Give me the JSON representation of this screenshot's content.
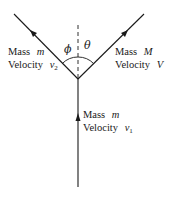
{
  "diagram": {
    "type": "collision-vector-diagram",
    "angles": {
      "left": "ϕ",
      "right": "θ"
    },
    "incoming": {
      "mass_label": "Mass",
      "mass_symbol": "m",
      "velocity_label": "Velocity",
      "velocity_symbol": "v",
      "velocity_subscript": "1"
    },
    "outgoing_left": {
      "mass_label": "Mass",
      "mass_symbol": "m",
      "velocity_label": "Velocity",
      "velocity_symbol": "v",
      "velocity_subscript": "2"
    },
    "outgoing_right": {
      "mass_label": "Mass",
      "mass_symbol": "M",
      "velocity_label": "Velocity",
      "velocity_symbol": "V"
    },
    "colors": {
      "line": "#1a1a1a",
      "background": "#ffffff"
    }
  }
}
